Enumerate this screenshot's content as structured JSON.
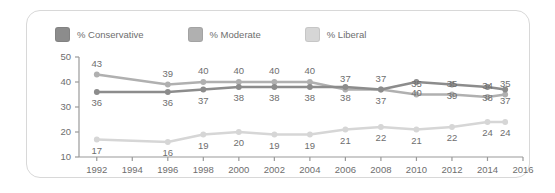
{
  "legend": {
    "items": [
      {
        "label": "% Conservative",
        "color": "#8c8c8c"
      },
      {
        "label": "% Moderate",
        "color": "#b0b0b0"
      },
      {
        "label": "% Liberal",
        "color": "#d6d6d6"
      }
    ]
  },
  "chart_data": {
    "type": "line",
    "title": "",
    "xlabel": "",
    "ylabel": "",
    "grid": false,
    "legend_position": "top-left",
    "ylim": [
      10,
      50
    ],
    "yticks": [
      10,
      20,
      30,
      40,
      50
    ],
    "xlim": [
      1991,
      2016
    ],
    "xticks": [
      1992,
      1994,
      1996,
      1998,
      2000,
      2002,
      2004,
      2006,
      2008,
      2010,
      2012,
      2014,
      2016
    ],
    "x": [
      1992,
      1996,
      1998,
      2000,
      2002,
      2004,
      2006,
      2008,
      2010,
      2012,
      2014,
      2015
    ],
    "series": [
      {
        "name": "% Conservative",
        "color": "#8c8c8c",
        "values": [
          36,
          36,
          37,
          38,
          38,
          38,
          38,
          37,
          40,
          39,
          38,
          37
        ],
        "label_side": "below"
      },
      {
        "name": "% Moderate",
        "color": "#b0b0b0",
        "values": [
          43,
          39,
          40,
          40,
          40,
          40,
          37,
          37,
          35,
          35,
          34,
          35
        ],
        "label_side": "above"
      },
      {
        "name": "% Liberal",
        "color": "#d6d6d6",
        "values": [
          17,
          16,
          19,
          20,
          19,
          19,
          21,
          22,
          21,
          22,
          24,
          24
        ],
        "label_side": "below"
      }
    ]
  }
}
